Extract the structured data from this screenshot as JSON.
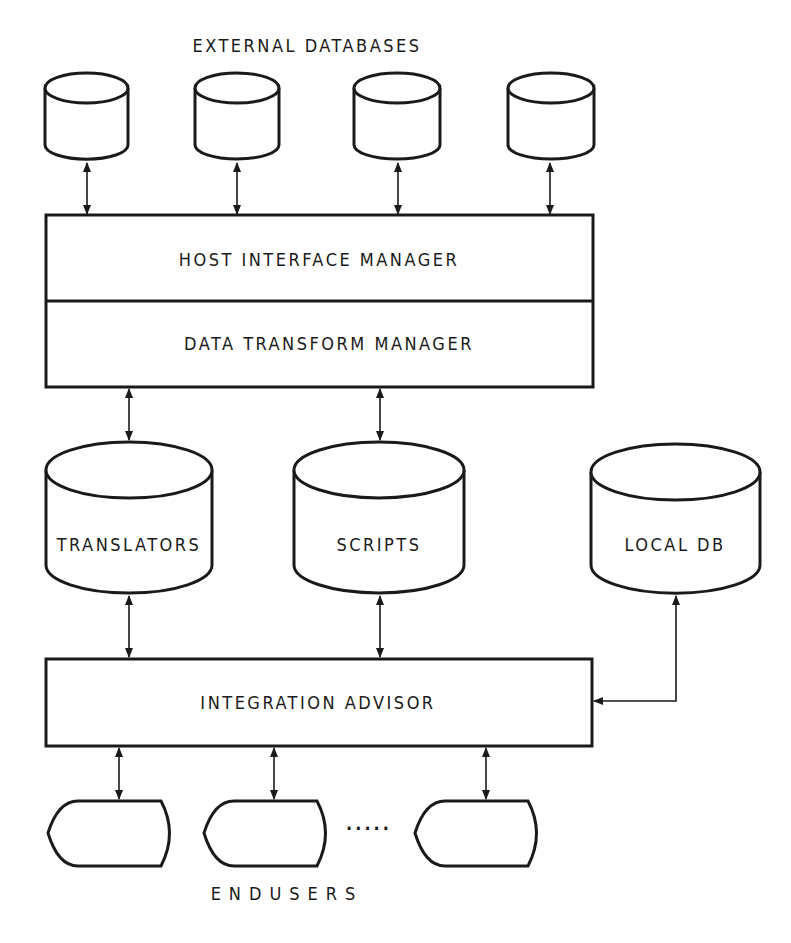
{
  "diagram": {
    "title_top": "EXTERNAL DATABASES",
    "title_bottom": "ENDUSERS",
    "boxes": {
      "host_interface_manager": "HOST INTERFACE MANAGER",
      "data_transform_manager": "DATA TRANSFORM MANAGER",
      "integration_advisor": "INTEGRATION ADVISOR"
    },
    "stores": {
      "translators": "TRANSLATORS",
      "scripts": "SCRIPTS",
      "local_db": "LOCAL DB"
    },
    "external_database_count": 4,
    "enduser_terminal_count": 3,
    "ellipsis": "....."
  }
}
